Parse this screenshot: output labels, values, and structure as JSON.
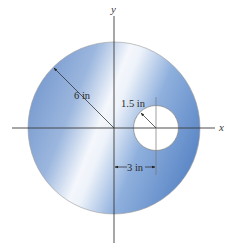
{
  "diagram": {
    "type": "geometry",
    "axes": {
      "x_label": "x",
      "y_label": "y"
    },
    "outer_circle": {
      "radius_label": "6 in",
      "radius_value": 6,
      "unit": "in"
    },
    "hole": {
      "radius_label": "1.5 in",
      "radius_value": 1.5,
      "offset_label": "3 in",
      "offset_value": 3,
      "unit": "in"
    },
    "colors": {
      "plate_blue_left": "#7b9fd4",
      "plate_blue_right": "#6f96cf",
      "plate_highlight": "#ffffff",
      "line": "#333333",
      "outline": "#8a8a8a"
    }
  }
}
